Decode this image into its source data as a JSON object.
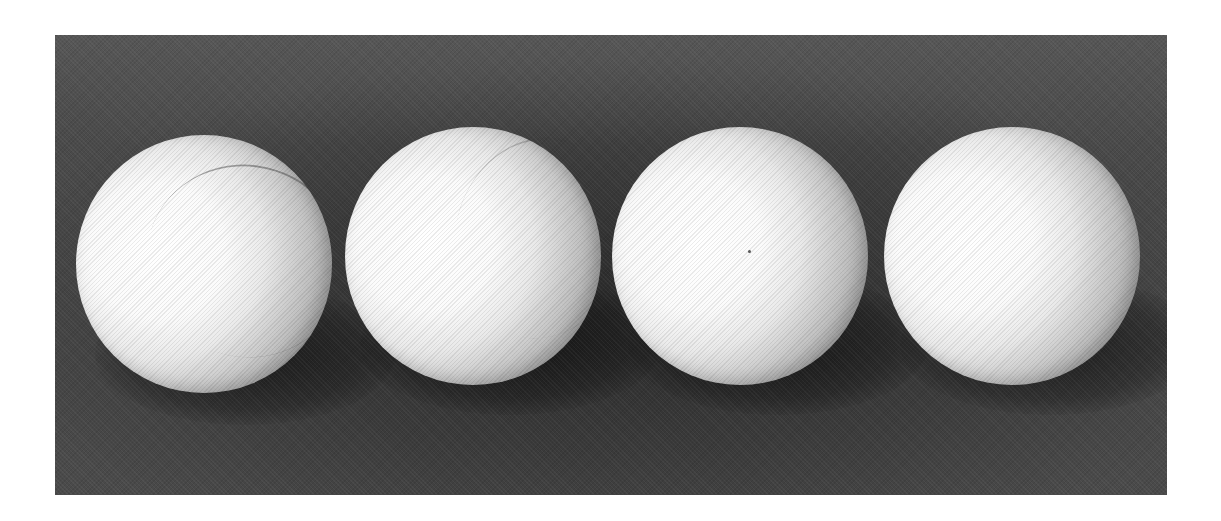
{
  "image": {
    "subject": "Four white spheres on a dark textured background",
    "background_color": "#3a3a3a",
    "border_color": "#ffffff",
    "photo_frame": {
      "x": 55,
      "y": 35,
      "width": 1112,
      "height": 460
    },
    "light_direction": "left",
    "balls": [
      {
        "cx": 204,
        "cy": 265,
        "r": 128,
        "has_seam": true
      },
      {
        "cx": 471,
        "cy": 257,
        "r": 128,
        "has_seam": true
      },
      {
        "cx": 739,
        "cy": 257,
        "r": 128,
        "has_seam": false
      },
      {
        "cx": 1011,
        "cy": 257,
        "r": 128,
        "has_seam": false
      }
    ]
  }
}
